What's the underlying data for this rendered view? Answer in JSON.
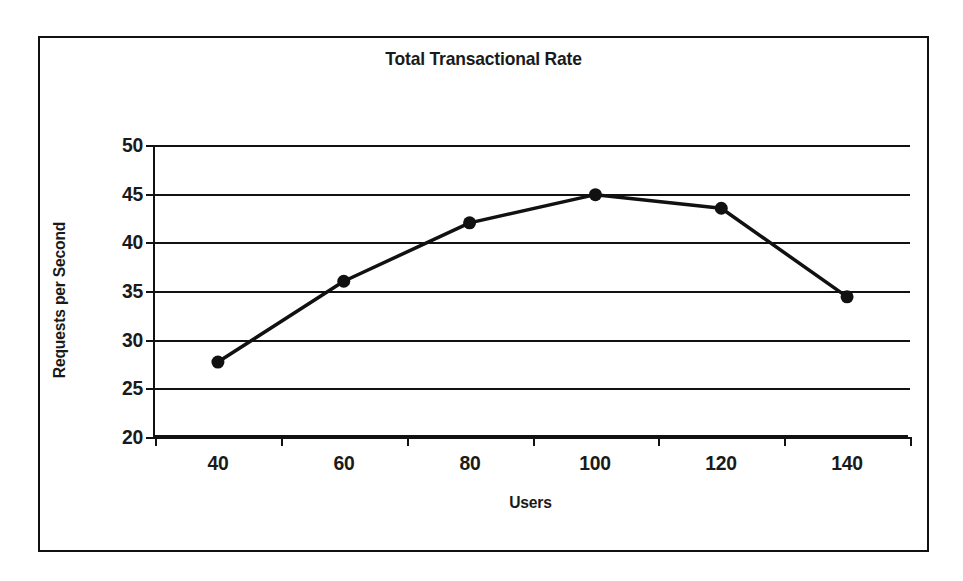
{
  "chart_data": {
    "type": "line",
    "title": "Total Transactional Rate",
    "xlabel": "Users",
    "ylabel": "Requests per Second",
    "categories": [
      40,
      60,
      80,
      100,
      120,
      140
    ],
    "x_tick_labels": [
      "40",
      "60",
      "80",
      "100",
      "120",
      "140"
    ],
    "values": [
      27.7,
      36.0,
      42.0,
      44.9,
      43.5,
      34.4
    ],
    "series": [
      {
        "name": "Requests per Second",
        "values": [
          27.7,
          36.0,
          42.0,
          44.9,
          43.5,
          34.4
        ]
      }
    ],
    "ylim": [
      20,
      50
    ],
    "y_ticks": [
      20,
      25,
      30,
      35,
      40,
      45,
      50
    ],
    "y_tick_labels": [
      "20",
      "25",
      "30",
      "35",
      "40",
      "45",
      "50"
    ],
    "grid": "horizontal",
    "legend": "none",
    "marker": "filled-circle",
    "line_color": "#111111",
    "marker_color": "#111111",
    "background_color": "#ffffff",
    "frame_color": "#111111"
  }
}
